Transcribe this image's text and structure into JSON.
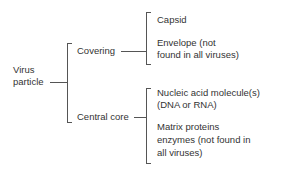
{
  "diagram": {
    "root": {
      "label_line1": "Virus",
      "label_line2": "particle"
    },
    "branches": [
      {
        "label": "Covering",
        "children": [
          {
            "line1": "Capsid"
          },
          {
            "line1": "Envelope (not",
            "line2": "found in all viruses)"
          }
        ]
      },
      {
        "label": "Central core",
        "children": [
          {
            "line1": "Nucleic acid molecule(s)",
            "line2": "(DNA or RNA)"
          },
          {
            "line1": "Matrix proteins",
            "line2": "enzymes (not found in",
            "line3": "all viruses)"
          }
        ]
      }
    ],
    "colors": {
      "line": "#555555",
      "text": "#333333",
      "background": "#ffffff"
    }
  }
}
